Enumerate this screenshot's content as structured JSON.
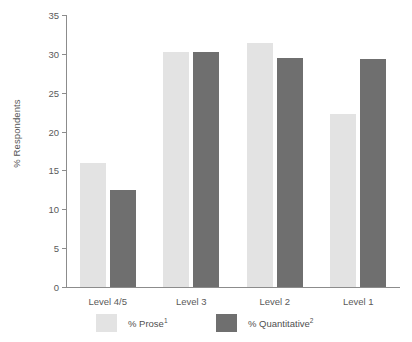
{
  "chart_data": {
    "type": "bar",
    "title": "",
    "xlabel": "",
    "ylabel": "% Respondents",
    "ylim": [
      0,
      35
    ],
    "yticks": [
      0,
      5,
      10,
      15,
      20,
      25,
      30,
      35
    ],
    "ytick_labels": [
      "0",
      "5",
      "10",
      "15",
      "20",
      "25",
      "30",
      "35"
    ],
    "grid": false,
    "legend_position": "bottom",
    "categories": [
      "Level 4/5",
      "Level 3",
      "Level 2",
      "Level 1"
    ],
    "series": [
      {
        "name": "% Prose",
        "footnote_marker": "1",
        "color": "#e3e3e3",
        "values": [
          16.0,
          30.2,
          31.4,
          22.2
        ]
      },
      {
        "name": "% Quantitative",
        "footnote_marker": "2",
        "color": "#6f6f6f",
        "values": [
          12.5,
          30.2,
          29.5,
          29.4
        ]
      }
    ]
  },
  "legend": {
    "entries": [
      {
        "label": "% Prose",
        "marker": "1"
      },
      {
        "label": "% Quantitative",
        "marker": "2"
      }
    ]
  }
}
